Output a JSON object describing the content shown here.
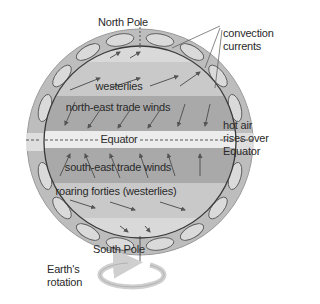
{
  "labels": {
    "north_pole": "North Pole",
    "south_pole": "South Pole",
    "convection_line1": "convection",
    "convection_line2": "currents",
    "hot_air_line1": "hot air",
    "hot_air_line2": "rises over",
    "hot_air_line3": "Equator",
    "rotation_line1": "Earth's",
    "rotation_line2": "rotation"
  },
  "bands": [
    {
      "name": "westerlies",
      "label": "westerlies",
      "color": "#c9c9c9"
    },
    {
      "name": "north-east-trade-winds",
      "label": "north-east trade winds",
      "color": "#a9a9a9"
    },
    {
      "name": "equator",
      "label": "Equator",
      "color": "#ececec"
    },
    {
      "name": "south-east-trade-winds",
      "label": "south-east trade winds",
      "color": "#a9a9a9"
    },
    {
      "name": "roaring-forties",
      "label": "roaring forties (westerlies)",
      "color": "#c9c9c9"
    }
  ],
  "colors": {
    "outer_ring": "#bdbdbd",
    "cells": "#d6d6d6",
    "outline": "#3a3a3a",
    "arrow": "#555555",
    "rotation_arrow": "#cfcfcf"
  }
}
